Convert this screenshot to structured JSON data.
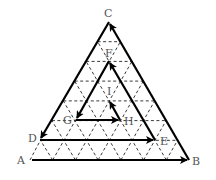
{
  "diagram": {
    "type": "spiral path on triangular grid",
    "points": {
      "A": {
        "label": "A",
        "x": 30,
        "y": 160
      },
      "B": {
        "label": "B",
        "x": 189,
        "y": 160
      },
      "C": {
        "label": "C",
        "x": 109,
        "y": 22
      },
      "D": {
        "label": "D",
        "x": 40,
        "y": 140
      },
      "E": {
        "label": "E",
        "x": 155,
        "y": 140
      },
      "F": {
        "label": "F",
        "x": 109,
        "y": 61
      },
      "G": {
        "label": "G",
        "x": 76,
        "y": 120
      },
      "H": {
        "label": "H",
        "x": 120,
        "y": 120
      },
      "I": {
        "label": "I",
        "x": 109,
        "y": 100
      }
    },
    "path_order": [
      "A",
      "B",
      "C",
      "D",
      "E",
      "F",
      "G",
      "H",
      "I"
    ],
    "labels": {
      "A": "A",
      "B": "B",
      "C": "C",
      "D": "D",
      "E": "E",
      "F": "F",
      "G": "G",
      "H": "H",
      "I": "I"
    },
    "grid": {
      "style": "dashed",
      "levels": 7
    }
  }
}
